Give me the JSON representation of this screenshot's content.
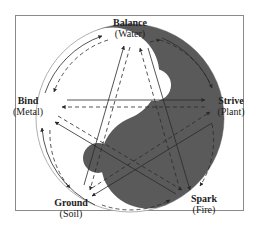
{
  "diagram": {
    "colors": {
      "yin": "#5a5a5a",
      "yang": "#ffffff",
      "frame": "#8a8a8a",
      "arrow": "#2a2a2a"
    },
    "nodes": [
      {
        "id": "balance",
        "name": "Balance",
        "element": "(Water)",
        "position": "top"
      },
      {
        "id": "strive",
        "name": "Strive",
        "element": "(Plant)",
        "position": "right"
      },
      {
        "id": "spark",
        "name": "Spark",
        "element": "(Fire)",
        "position": "bottom-right"
      },
      {
        "id": "ground",
        "name": "Ground",
        "element": "(Soil)",
        "position": "bottom-left"
      },
      {
        "id": "bind",
        "name": "Bind",
        "element": "(Metal)",
        "position": "left"
      }
    ],
    "edges": {
      "outer_cycle_solid": "clockwise generating cycle around circle",
      "outer_cycle_dashed": "counter-cycle dashed arrows inside circle",
      "star_solid": "solid pentagram arrows",
      "star_dashed": "dashed pentagram arrows"
    }
  }
}
